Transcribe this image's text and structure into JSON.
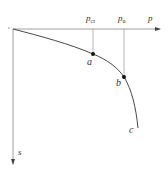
{
  "diagram": {
    "type": "load-settlement curve",
    "axes": {
      "x_label": "p",
      "y_label": "s",
      "origin_label": ""
    },
    "markers": [
      {
        "name": "critical-load",
        "symbol": "p",
        "subscript": "cr"
      },
      {
        "name": "ultimate-load",
        "symbol": "p",
        "subscript": "u"
      }
    ],
    "points": [
      {
        "id": "a",
        "label": "a"
      },
      {
        "id": "b",
        "label": "b"
      },
      {
        "id": "c",
        "label": "c"
      }
    ],
    "colors": {
      "axis": "#888888",
      "curve": "#333333",
      "guide": "#999999",
      "point": "#111111",
      "text": "#333333"
    }
  }
}
